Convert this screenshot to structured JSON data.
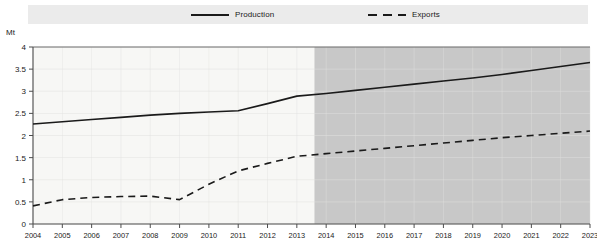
{
  "legend": {
    "entries": [
      {
        "label": "Production",
        "style": "solid",
        "icon": "solid-line-icon"
      },
      {
        "label": "Exports",
        "style": "dashed",
        "icon": "dashed-line-icon"
      }
    ]
  },
  "axis": {
    "unit": "Mt",
    "y_ticks": [
      "4",
      "3.5",
      "3",
      "2.5",
      "2",
      "1.5",
      "1",
      "0.5",
      "0"
    ],
    "x_ticks": [
      "2004",
      "2005",
      "2006",
      "2007",
      "2008",
      "2009",
      "2010",
      "2011",
      "2012",
      "2013",
      "2014",
      "2015",
      "2016",
      "2017",
      "2018",
      "2019",
      "2020",
      "2021",
      "2022",
      "2023"
    ]
  },
  "colors": {
    "line": "#1a1a1a",
    "historical_band": "#f7f7f5",
    "projection_band": "#c8c8c8",
    "legend_band": "#ebebeb",
    "axis": "#4d4d4d",
    "grid": "#e2e2e0"
  },
  "chart_data": {
    "type": "line",
    "title": "",
    "subtitle": "",
    "xlabel": "",
    "ylabel": "Mt",
    "ylim": [
      0,
      4
    ],
    "ytick_step": 0.5,
    "grid": true,
    "legend_position": "top",
    "x": [
      2004,
      2005,
      2006,
      2007,
      2008,
      2009,
      2010,
      2011,
      2012,
      2013,
      2014,
      2015,
      2016,
      2017,
      2018,
      2019,
      2020,
      2021,
      2022,
      2023
    ],
    "series": [
      {
        "name": "Production",
        "style": "solid",
        "values": [
          2.26,
          2.31,
          2.36,
          2.41,
          2.46,
          2.5,
          2.53,
          2.56,
          2.72,
          2.89,
          2.95,
          3.02,
          3.09,
          3.16,
          3.23,
          3.3,
          3.38,
          3.47,
          3.56,
          3.65
        ]
      },
      {
        "name": "Exports",
        "style": "dashed",
        "values": [
          0.41,
          0.55,
          0.6,
          0.62,
          0.63,
          0.55,
          0.9,
          1.2,
          1.37,
          1.53,
          1.59,
          1.65,
          1.71,
          1.77,
          1.83,
          1.89,
          1.95,
          2.0,
          2.05,
          2.1
        ]
      }
    ],
    "shaded_region": {
      "name": "projection",
      "start_x": 2013.6,
      "end_x": 2023
    }
  }
}
